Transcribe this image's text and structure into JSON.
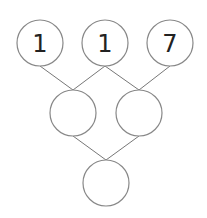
{
  "diagram": {
    "type": "number-pyramid",
    "top_row": [
      {
        "value": "1",
        "cx": 40,
        "cy": 43
      },
      {
        "value": "1",
        "cx": 105,
        "cy": 43
      },
      {
        "value": "7",
        "cx": 170,
        "cy": 43
      }
    ],
    "middle_row": [
      {
        "value": "",
        "cx": 73,
        "cy": 113
      },
      {
        "value": "",
        "cx": 139,
        "cy": 113
      }
    ],
    "bottom_row": [
      {
        "value": "",
        "cx": 106,
        "cy": 183
      }
    ],
    "radius": 23,
    "stroke_color": "#888888",
    "line_color": "#777777"
  }
}
